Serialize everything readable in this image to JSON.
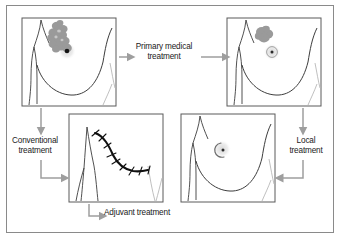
{
  "figure": {
    "domain": "medical-flow-diagram",
    "background_color": "#ffffff",
    "frame_border_color": "#8a8a8a"
  },
  "colors": {
    "outline": "#3d3d3d",
    "tumor_fill": "#9a9a9a",
    "tumor_fill_light": "#bdbdbd",
    "scar_black": "#101010",
    "arrow_gray": "#9e9e9e",
    "panel_border": "#5a5a5a",
    "faint_line": "#b8b8b8",
    "text": "#1a1a1a"
  },
  "panels": [
    {
      "id": "panel-initial-tumor",
      "name": "initial-tumour-panel",
      "position": "top-left",
      "description": "Breast with large irregular tumour mass and nipple",
      "x": 22,
      "y": 18,
      "w": 94,
      "h": 88,
      "features": [
        "large-irregular-tumour",
        "nipple-dark-dot",
        "areola-halo",
        "breast-contour",
        "neck-lines",
        "arm-line"
      ]
    },
    {
      "id": "panel-shrunken-tumor",
      "name": "post-primary-treatment-panel",
      "position": "top-right",
      "description": "Breast with reduced tumour mass after primary medical treatment",
      "x": 227,
      "y": 18,
      "w": 94,
      "h": 88,
      "features": [
        "small-tumour",
        "nipple-ring",
        "areola-halo",
        "breast-contour",
        "neck-lines",
        "arm-line"
      ]
    },
    {
      "id": "panel-mastectomy",
      "name": "mastectomy-scar-panel",
      "position": "bottom-left",
      "description": "Chest wall after mastectomy showing sutured scar",
      "x": 69,
      "y": 114,
      "w": 94,
      "h": 88,
      "features": [
        "sutured-scar",
        "suture-marks",
        "chest-lines",
        "arm-line"
      ]
    },
    {
      "id": "panel-conservation",
      "name": "breast-conservation-panel",
      "position": "bottom-right",
      "description": "Conserved breast with small local excision scar near nipple",
      "x": 181,
      "y": 114,
      "w": 94,
      "h": 88,
      "features": [
        "small-crescent-scar",
        "nipple-dot",
        "areola-halo",
        "breast-contour",
        "neck-lines",
        "arm-line"
      ]
    }
  ],
  "labels": {
    "primary_medical_treatment": "Primary medical\ntreatment",
    "conventional_treatment": "Conventional\ntreatment",
    "local_treatment": "Local\ntreatment",
    "adjuvant_treatment": "Adjuvant treatment"
  },
  "arrows": [
    {
      "name": "arrow-initial-to-label-primary",
      "type": "horizontal-right",
      "from": "panel-initial-tumor",
      "to": "label-primary"
    },
    {
      "name": "arrow-label-primary-to-shrunken",
      "type": "horizontal-right",
      "from": "label-primary",
      "to": "panel-shrunken-tumor"
    },
    {
      "name": "arrow-initial-down-conventional",
      "type": "vertical-down",
      "from": "panel-initial-tumor",
      "to": "label-conventional"
    },
    {
      "name": "arrow-conventional-to-mastectomy",
      "type": "elbow-down-right",
      "from": "label-conventional",
      "to": "panel-mastectomy"
    },
    {
      "name": "arrow-shrunken-down-local",
      "type": "vertical-down",
      "from": "panel-shrunken-tumor",
      "to": "label-local"
    },
    {
      "name": "arrow-local-to-conservation",
      "type": "elbow-down-left",
      "from": "label-local",
      "to": "panel-conservation"
    },
    {
      "name": "arrow-mastectomy-to-adjuvant",
      "type": "elbow-down-right",
      "from": "panel-mastectomy",
      "to": "label-adjuvant"
    }
  ]
}
